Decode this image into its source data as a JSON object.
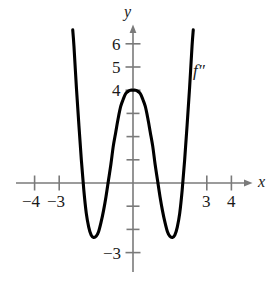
{
  "figure": {
    "background_color": "#ffffff",
    "axis_color": "#808080",
    "curve_color": "#000000",
    "text_color": "#1a1a1a",
    "width": 279,
    "height": 282
  },
  "axes": {
    "x_label": "x",
    "y_label": "y",
    "origin_px": {
      "x": 133,
      "y": 183
    },
    "unit_px": {
      "x": 24.6,
      "y": 23.2
    },
    "x_tick_labels": [
      {
        "value": -4,
        "text": "−4"
      },
      {
        "value": -3,
        "text": "−3"
      },
      {
        "value": 3,
        "text": "3"
      },
      {
        "value": 4,
        "text": "4"
      }
    ],
    "y_tick_labels": [
      {
        "value": 6,
        "text": "6"
      },
      {
        "value": 5,
        "text": "5"
      },
      {
        "value": 4,
        "text": "4"
      },
      {
        "value": -3,
        "text": "−3"
      }
    ],
    "x_ticks_drawn": [
      -4,
      -3,
      3,
      4
    ],
    "y_ticks_drawn": [
      6,
      5,
      4,
      3,
      2,
      1,
      -1,
      -2,
      -3
    ]
  },
  "curve": {
    "label": "f″",
    "label_position": {
      "x": 0,
      "y": 0
    }
  },
  "chart_data": {
    "type": "line",
    "title": "",
    "xlabel": "x",
    "ylabel": "y",
    "xlim": [
      -4.9,
      4.9
    ],
    "ylim": [
      -3.6,
      6.9
    ],
    "grid": false,
    "legend": "none",
    "annotations": [
      {
        "text": "f″",
        "x": 2.5,
        "y": 4.8
      }
    ],
    "series": [
      {
        "name": "f''",
        "description": "W-shaped quartic: local maximum (0, 4), two minima near (±1.55, -2.3), four x-intercepts near ±0.9 and ±2.2",
        "x": [
          -2.45,
          -2.4,
          -2.3,
          -2.2,
          -2.1,
          -2.0,
          -1.9,
          -1.8,
          -1.7,
          -1.6,
          -1.5,
          -1.4,
          -1.3,
          -1.2,
          -1.1,
          -1.0,
          -0.9,
          -0.8,
          -0.7,
          -0.6,
          -0.5,
          -0.4,
          -0.3,
          -0.2,
          -0.1,
          0.0,
          0.1,
          0.2,
          0.3,
          0.4,
          0.5,
          0.6,
          0.7,
          0.8,
          0.9,
          1.0,
          1.1,
          1.2,
          1.3,
          1.4,
          1.5,
          1.6,
          1.7,
          1.8,
          1.9,
          2.0,
          2.1,
          2.2,
          2.3,
          2.4,
          2.45
        ],
        "y": [
          6.6,
          5.9,
          4.1,
          2.5,
          1.0,
          -0.3,
          -1.3,
          -1.9,
          -2.25,
          -2.35,
          -2.3,
          -2.1,
          -1.7,
          -1.2,
          -0.6,
          0.1,
          0.8,
          1.6,
          2.2,
          2.8,
          3.3,
          3.6,
          3.85,
          3.95,
          4.0,
          4.0,
          4.0,
          3.95,
          3.85,
          3.6,
          3.3,
          2.8,
          2.2,
          1.6,
          0.8,
          0.1,
          -0.6,
          -1.2,
          -1.7,
          -2.1,
          -2.3,
          -2.35,
          -2.25,
          -1.9,
          -1.3,
          -0.3,
          1.0,
          2.5,
          4.1,
          5.9,
          6.6
        ],
        "key_points": {
          "local_maximum": {
            "x": 0,
            "y": 4
          },
          "minima": [
            {
              "x": -1.55,
              "y": -2.35
            },
            {
              "x": 1.55,
              "y": -2.35
            }
          ],
          "x_intercepts": [
            -2.2,
            -0.93,
            0.93,
            2.2
          ]
        }
      }
    ]
  }
}
